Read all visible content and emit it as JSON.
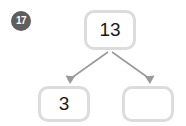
{
  "worksheet": {
    "question_number": "17",
    "diagram_type": "number-bond",
    "colors": {
      "badge_background": "#5e5e5e",
      "badge_text": "#ffffff",
      "box_border": "#dcdcdc",
      "box_fill": "#ffffff",
      "connector": "#9a9a9a",
      "page_background": "#ffffff",
      "value_text": "#1a1a1a"
    },
    "parent": {
      "label": "13",
      "filled": true
    },
    "children": [
      {
        "label": "3",
        "filled": true
      },
      {
        "label": "",
        "filled": false
      }
    ]
  }
}
